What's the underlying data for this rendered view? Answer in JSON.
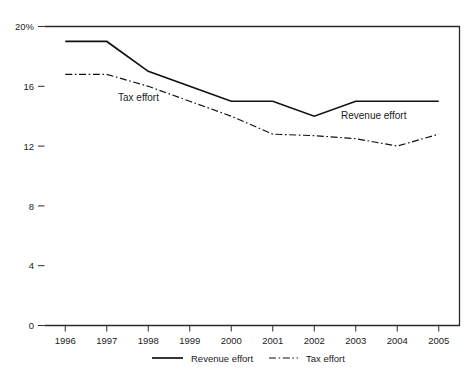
{
  "chart_data": {
    "type": "line",
    "title": "",
    "xlabel": "",
    "ylabel": "",
    "y_unit": "%",
    "categories": [
      "1996",
      "1997",
      "1998",
      "1999",
      "2000",
      "2001",
      "2002",
      "2003",
      "2004",
      "2005"
    ],
    "x_tick_labels": [
      "1996",
      "1997",
      "1998",
      "1999",
      "2000",
      "2001",
      "2002",
      "2003",
      "2004",
      "2005"
    ],
    "y_tick_labels": [
      "0",
      "4",
      "8",
      "12",
      "16",
      "20%"
    ],
    "y_ticks": [
      0,
      4,
      8,
      12,
      16,
      20
    ],
    "ylim": [
      0,
      20
    ],
    "grid": false,
    "legend_position": "bottom-center",
    "series": [
      {
        "name": "Revenue effort",
        "style": "solid",
        "color": "#111111",
        "values": [
          19.0,
          19.0,
          17.0,
          16.0,
          15.0,
          15.0,
          14.0,
          15.0,
          15.0,
          15.0
        ]
      },
      {
        "name": "Tax effort",
        "style": "dash-dot",
        "color": "#111111",
        "values": [
          16.8,
          16.8,
          16.0,
          15.0,
          14.0,
          12.8,
          12.7,
          12.5,
          12.0,
          12.8
        ]
      }
    ],
    "annotations": [
      {
        "text": "Tax effort",
        "x_px": 118,
        "y_px": 101
      },
      {
        "text": "Revenue effort",
        "x_px": 341,
        "y_px": 119
      }
    ]
  },
  "legend": {
    "items": [
      {
        "label": "Revenue effort",
        "style": "solid"
      },
      {
        "label": "Tax effort",
        "style": "dash-dot"
      }
    ]
  },
  "axis": {
    "y_top_label": "20%",
    "y_labels": [
      "20%",
      "16",
      "12",
      "8",
      "4",
      "0"
    ]
  }
}
